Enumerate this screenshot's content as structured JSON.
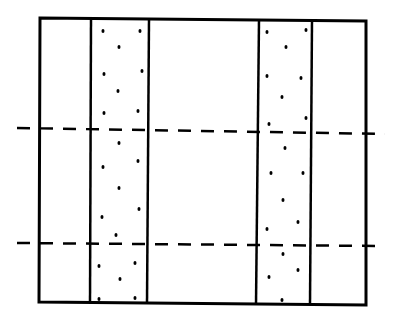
{
  "diagram": {
    "type": "schematic",
    "colors": {
      "background": "#ffffff",
      "stroke": "#000000",
      "dot": "#000000"
    },
    "frame": {
      "corners": [
        [
          40,
          18
        ],
        [
          366,
          21
        ],
        [
          366,
          305
        ],
        [
          39,
          302
        ]
      ],
      "stroke_width": 3
    },
    "vertical_lines": [
      {
        "name": "band-left-edge-1",
        "x1": 91,
        "y1": 19,
        "x2": 90,
        "y2": 303,
        "stroke_width": 2.5
      },
      {
        "name": "band-left-edge-2",
        "x1": 149,
        "y1": 19,
        "x2": 147,
        "y2": 303,
        "stroke_width": 2.5
      },
      {
        "name": "band-right-edge-1",
        "x1": 259,
        "y1": 20,
        "x2": 256,
        "y2": 304,
        "stroke_width": 2.5
      },
      {
        "name": "band-right-edge-2",
        "x1": 312,
        "y1": 20,
        "x2": 310,
        "y2": 304,
        "stroke_width": 2.5
      }
    ],
    "dashed_lines": [
      {
        "name": "dashed-line-upper",
        "x1": 17,
        "y1": 128,
        "x2": 385,
        "y2": 134,
        "dash": "13,10",
        "stroke_width": 2.5
      },
      {
        "name": "dashed-line-lower",
        "x1": 17,
        "y1": 243,
        "x2": 382,
        "y2": 246,
        "dash": "13,10",
        "stroke_width": 2.5
      }
    ],
    "stipple_bands": [
      {
        "name": "stipple-band-left",
        "dots": [
          [
            103,
            31
          ],
          [
            140,
            31
          ],
          [
            119,
            47
          ],
          [
            104,
            74
          ],
          [
            142,
            71
          ],
          [
            118,
            91
          ],
          [
            104,
            113
          ],
          [
            138,
            111
          ],
          [
            119,
            143
          ],
          [
            138,
            161
          ],
          [
            103,
            167
          ],
          [
            119,
            188
          ],
          [
            102,
            217
          ],
          [
            139,
            209
          ],
          [
            116,
            235
          ],
          [
            99,
            266
          ],
          [
            135,
            263
          ],
          [
            120,
            279
          ],
          [
            99,
            299
          ],
          [
            135,
            298
          ]
        ]
      },
      {
        "name": "stipple-band-right",
        "dots": [
          [
            267,
            32
          ],
          [
            306,
            30
          ],
          [
            286,
            47
          ],
          [
            267,
            76
          ],
          [
            301,
            78
          ],
          [
            282,
            97
          ],
          [
            269,
            124
          ],
          [
            306,
            118
          ],
          [
            285,
            148
          ],
          [
            271,
            173
          ],
          [
            303,
            173
          ],
          [
            283,
            200
          ],
          [
            267,
            229
          ],
          [
            298,
            222
          ],
          [
            283,
            254
          ],
          [
            269,
            277
          ],
          [
            298,
            270
          ],
          [
            282,
            300
          ]
        ]
      }
    ],
    "dot_radius": 1.8
  }
}
